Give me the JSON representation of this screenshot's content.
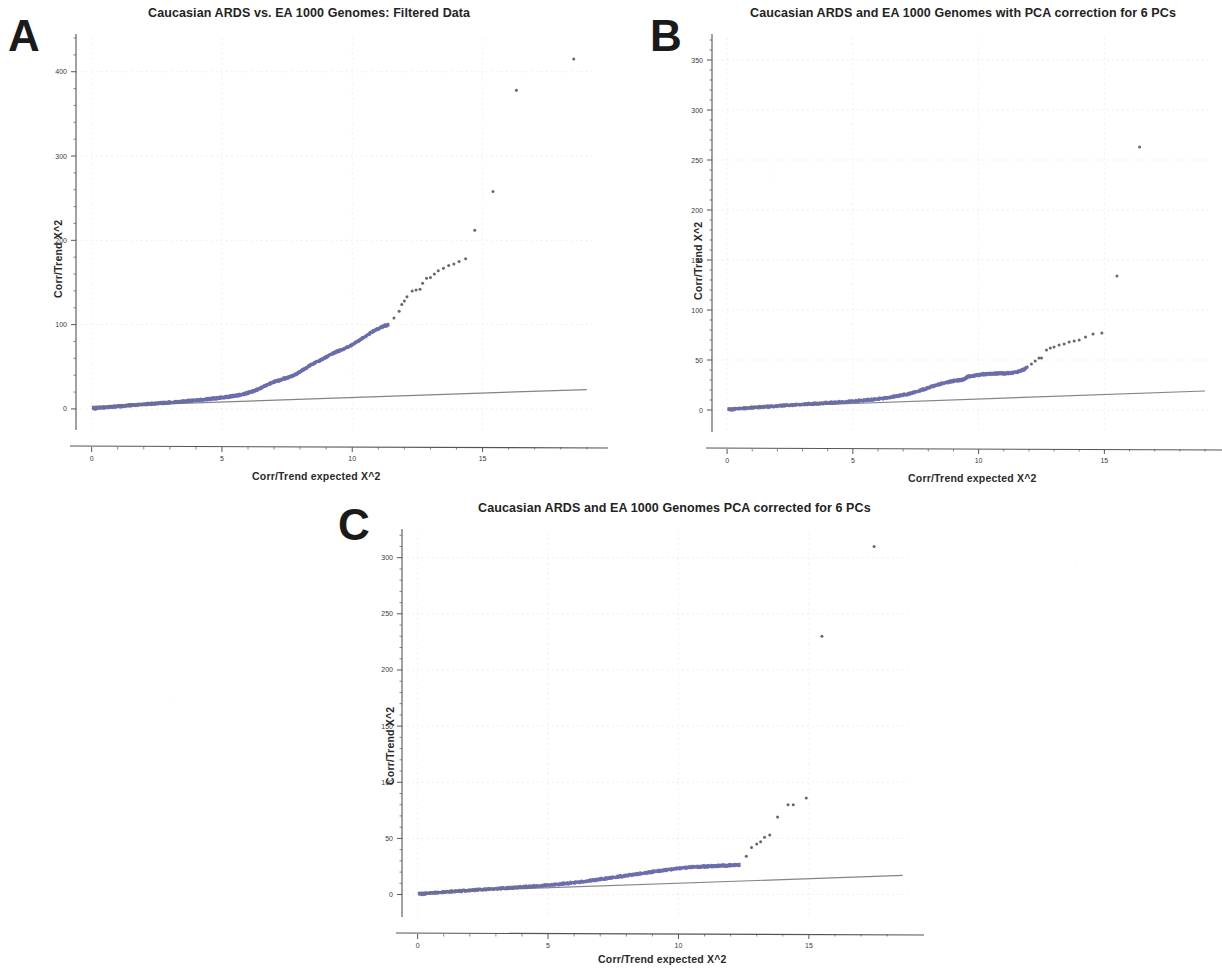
{
  "figure": {
    "background": "#ffffff",
    "point_color": "#6a6fb2",
    "tail_point_color": "#575757",
    "reference_line_color": "#6f6f6f",
    "axis_color": "#555555",
    "grid_color": "#cfcfcf"
  },
  "panels": [
    {
      "letter": "A",
      "title": "Caucasian ARDS vs. EA 1000 Genomes: Filtered Data",
      "xlabel": "Corr/Trend  expected X^2",
      "ylabel": "Corr/Trend  X^2",
      "xticks": [
        "0",
        "5",
        "10",
        "15"
      ],
      "xtick_values": [
        0,
        5,
        10,
        15
      ],
      "yticks": [
        "0",
        "100",
        "200",
        "300",
        "400"
      ],
      "ytick_values": [
        0,
        100,
        200,
        300,
        400
      ],
      "xlim": [
        -0.6,
        19.2
      ],
      "ylim": [
        -25,
        440
      ]
    },
    {
      "letter": "B",
      "title": "Caucasian ARDS and EA 1000 Genomes  with PCA correction for 6 PCs",
      "xlabel": "Corr/Trend  expected X^2",
      "ylabel": "Corr/Trend  X^2",
      "xticks": [
        "0",
        "5",
        "10",
        "15"
      ],
      "xtick_values": [
        0,
        5,
        10,
        15
      ],
      "yticks": [
        "0",
        "50",
        "100",
        "150",
        "200",
        "250",
        "300",
        "350"
      ],
      "ytick_values": [
        0,
        50,
        100,
        150,
        200,
        250,
        300,
        350
      ],
      "xlim": [
        -0.6,
        19.2
      ],
      "ylim": [
        -22,
        372
      ]
    },
    {
      "letter": "C",
      "title": "Caucasian ARDS and EA 1000 Genomes PCA corrected for 6 PCs",
      "xlabel": "Corr/Trend  expected X^2",
      "ylabel": "Corr/Trend  X^2",
      "xticks": [
        "0",
        "5",
        "10",
        "15"
      ],
      "xtick_values": [
        0,
        5,
        10,
        15
      ],
      "yticks": [
        "0",
        "50",
        "100",
        "150",
        "200",
        "250",
        "300"
      ],
      "ytick_values": [
        0,
        50,
        100,
        150,
        200,
        250,
        300
      ],
      "xlim": [
        -0.6,
        18.8
      ],
      "ylim": [
        -20,
        322
      ]
    }
  ],
  "chart_data": [
    {
      "type": "scatter",
      "panel": "A",
      "title": "Caucasian ARDS vs. EA 1000 Genomes: Filtered Data",
      "xlabel": "Corr/Trend  expected X^2",
      "ylabel": "Corr/Trend  X^2",
      "xlim": [
        -0.6,
        19.2
      ],
      "ylim": [
        -25,
        440
      ],
      "grid": true,
      "legend": "none",
      "series": [
        {
          "name": "observed vs expected (dense body)",
          "color": "#6a6fb2",
          "x": [
            0.05,
            0.2,
            0.4,
            0.6,
            0.8,
            1.0,
            1.2,
            1.4,
            1.6,
            1.8,
            2.0,
            2.2,
            2.4,
            2.6,
            2.8,
            3.0,
            3.2,
            3.4,
            3.6,
            3.8,
            4.0,
            4.2,
            4.4,
            4.6,
            4.8,
            5.0,
            5.2,
            5.4,
            5.6,
            5.8,
            6.0,
            6.2,
            6.4,
            6.6,
            6.8,
            7.0,
            7.2,
            7.4,
            7.6,
            7.8,
            8.0,
            8.2,
            8.4,
            8.6,
            8.8,
            9.0,
            9.2,
            9.4,
            9.6,
            9.8,
            10.0,
            10.2,
            10.4,
            10.6,
            10.8,
            11.0,
            11.2,
            11.4
          ],
          "y": [
            0.4,
            0.9,
            1.4,
            1.9,
            2.4,
            2.9,
            3.4,
            3.9,
            4.4,
            4.9,
            5.3,
            5.8,
            6.3,
            6.8,
            7.2,
            7.7,
            8.2,
            8.7,
            9.2,
            9.7,
            10.2,
            10.8,
            11.4,
            12.0,
            12.7,
            13.4,
            14.2,
            15.1,
            16.1,
            17.4,
            19.0,
            21.0,
            23.5,
            26.5,
            29.5,
            32.0,
            34.0,
            36.0,
            38.0,
            40.5,
            44.0,
            48.0,
            52.0,
            55.0,
            58.0,
            61.5,
            65.0,
            68.0,
            70.0,
            73.0,
            76.0,
            80.0,
            84.0,
            88.0,
            92.0,
            95.0,
            98.0,
            100.0
          ]
        },
        {
          "name": "upper tail (sparse)",
          "color": "#575757",
          "x": [
            11.6,
            11.8,
            11.9,
            12.0,
            12.1,
            12.3,
            12.45,
            12.6,
            12.7,
            12.85,
            13.0,
            13.15,
            13.3,
            13.5,
            13.7,
            13.9,
            14.1,
            14.35,
            14.7,
            15.4,
            16.3,
            18.5
          ],
          "y": [
            108,
            116,
            124,
            128,
            133,
            140,
            141,
            142,
            149,
            155,
            156,
            160,
            164,
            167,
            170,
            172,
            175,
            178,
            212,
            258,
            378,
            415
          ]
        },
        {
          "name": "expected (null) reference line",
          "color": "#6f6f6f",
          "x": [
            0,
            19.0
          ],
          "y": [
            3,
            23
          ]
        }
      ]
    },
    {
      "type": "scatter",
      "panel": "B",
      "title": "Caucasian ARDS and EA 1000 Genomes  with PCA correction for 6 PCs",
      "xlabel": "Corr/Trend  expected X^2",
      "ylabel": "Corr/Trend  X^2",
      "xlim": [
        -0.6,
        19.2
      ],
      "ylim": [
        -22,
        372
      ],
      "grid": true,
      "legend": "none",
      "series": [
        {
          "name": "observed vs expected (dense body)",
          "color": "#6a6fb2",
          "x": [
            0.05,
            0.3,
            0.6,
            0.9,
            1.2,
            1.5,
            1.8,
            2.1,
            2.4,
            2.7,
            3.0,
            3.3,
            3.6,
            3.9,
            4.2,
            4.5,
            4.8,
            5.1,
            5.4,
            5.7,
            6.0,
            6.3,
            6.6,
            6.9,
            7.2,
            7.5,
            7.8,
            8.1,
            8.4,
            8.7,
            9.0,
            9.2,
            9.35,
            9.5,
            9.55,
            9.8,
            10.0,
            10.2,
            10.4,
            10.6,
            10.8,
            11.0,
            11.2,
            11.4,
            11.6,
            11.8,
            11.95
          ],
          "y": [
            0.3,
            0.9,
            1.5,
            2.1,
            2.6,
            3.1,
            3.6,
            4.1,
            4.6,
            5.0,
            5.5,
            6.0,
            6.4,
            6.9,
            7.4,
            7.9,
            8.4,
            9.0,
            9.6,
            10.2,
            11.0,
            12.0,
            13.2,
            14.5,
            16.0,
            18.0,
            20.5,
            23.0,
            25.5,
            27.5,
            29.0,
            29.8,
            30.2,
            31.8,
            33.4,
            34.0,
            35.2,
            35.8,
            36.2,
            36.4,
            36.5,
            36.6,
            36.8,
            37.2,
            38.5,
            40.5,
            43.0
          ]
        },
        {
          "name": "upper tail (sparse)",
          "color": "#575757",
          "x": [
            12.1,
            12.25,
            12.4,
            12.5,
            12.7,
            12.85,
            13.0,
            13.2,
            13.4,
            13.6,
            13.8,
            14.0,
            14.25,
            14.55,
            14.9,
            15.5,
            16.4
          ],
          "y": [
            46,
            49,
            52,
            52,
            60,
            62,
            63,
            65,
            66,
            68,
            69,
            70,
            73,
            76,
            77,
            134,
            263
          ]
        },
        {
          "name": "expected (null) reference line",
          "color": "#6f6f6f",
          "x": [
            0,
            19.0
          ],
          "y": [
            2,
            19
          ]
        }
      ]
    },
    {
      "type": "scatter",
      "panel": "C",
      "title": "Caucasian ARDS and EA 1000 Genomes PCA corrected for 6 PCs",
      "xlabel": "Corr/Trend  expected X^2",
      "ylabel": "Corr/Trend  X^2",
      "xlim": [
        -0.6,
        18.8
      ],
      "ylim": [
        -20,
        322
      ],
      "grid": true,
      "legend": "none",
      "series": [
        {
          "name": "observed vs expected (dense body)",
          "color": "#6a6fb2",
          "x": [
            0.05,
            0.3,
            0.6,
            0.9,
            1.2,
            1.5,
            1.8,
            2.1,
            2.4,
            2.7,
            3.0,
            3.3,
            3.6,
            3.9,
            4.2,
            4.5,
            4.8,
            5.1,
            5.4,
            5.7,
            6.0,
            6.3,
            6.6,
            6.9,
            7.2,
            7.5,
            7.8,
            8.1,
            8.4,
            8.7,
            9.0,
            9.3,
            9.6,
            9.9,
            10.2,
            10.5,
            10.8,
            11.0,
            11.2,
            11.4,
            11.6,
            11.8,
            12.0,
            12.2,
            12.35
          ],
          "y": [
            0.3,
            0.8,
            1.4,
            1.9,
            2.4,
            2.9,
            3.4,
            3.8,
            4.3,
            4.7,
            5.1,
            5.6,
            6.0,
            6.5,
            7.0,
            7.5,
            8.0,
            8.6,
            9.2,
            9.9,
            10.6,
            11.4,
            12.3,
            13.2,
            14.2,
            15.2,
            16.2,
            17.2,
            18.2,
            19.2,
            20.2,
            21.2,
            22.2,
            23.0,
            23.8,
            24.4,
            24.8,
            25.0,
            25.2,
            25.4,
            25.6,
            25.8,
            26.0,
            26.2,
            26.3
          ]
        },
        {
          "name": "upper tail (sparse)",
          "color": "#575757",
          "x": [
            12.6,
            12.8,
            13.0,
            13.15,
            13.3,
            13.5,
            13.8,
            14.2,
            14.4,
            14.9,
            15.5,
            17.5
          ],
          "y": [
            34,
            42,
            45,
            47,
            51,
            53,
            69,
            80,
            80,
            86,
            230,
            310
          ]
        },
        {
          "name": "expected (null) reference line",
          "color": "#6f6f6f",
          "x": [
            0,
            18.6
          ],
          "y": [
            2,
            17
          ]
        }
      ]
    }
  ]
}
